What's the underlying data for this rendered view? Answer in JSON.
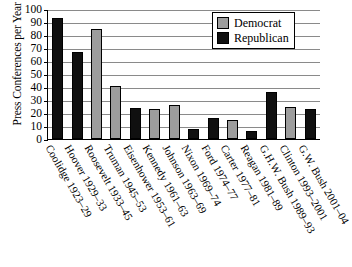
{
  "chart_data": {
    "type": "bar",
    "title": "",
    "xlabel": "",
    "ylabel": "Press Conferences per Year",
    "ylim": [
      0,
      100
    ],
    "yticks": [
      0,
      10,
      20,
      30,
      40,
      50,
      60,
      70,
      80,
      90,
      100
    ],
    "grid": true,
    "legend_position": "top-right",
    "categories": [
      "Coolidge 1923–29",
      "Hoover 1929–33",
      "Roosevelt 1933–45",
      "Truman 1945–53",
      "Eisenhower 1953–61",
      "Kennedy 1961–63",
      "Johnson 1963–69",
      "Nixon 1969–74",
      "Ford 1974–77",
      "Carter 1977–81",
      "Reagan 1981–89",
      "G.H.W. Bush 1989–93",
      "Clinton 1993–2001",
      "G.W. Bush 2001–04"
    ],
    "values": [
      93,
      67,
      85,
      41,
      24,
      23,
      26,
      8,
      16,
      15,
      6,
      36,
      25,
      23
    ],
    "party": [
      "republican",
      "republican",
      "democrat",
      "democrat",
      "republican",
      "democrat",
      "democrat",
      "republican",
      "republican",
      "democrat",
      "republican",
      "republican",
      "democrat",
      "republican"
    ],
    "series": [
      {
        "name": "Democrat",
        "color": "#9d9d9d",
        "points": [
          {
            "category": "Roosevelt 1933–45",
            "value": 85
          },
          {
            "category": "Truman 1945–53",
            "value": 41
          },
          {
            "category": "Kennedy 1961–63",
            "value": 23
          },
          {
            "category": "Johnson 1963–69",
            "value": 26
          },
          {
            "category": "Carter 1977–81",
            "value": 15
          },
          {
            "category": "Clinton 1993–2001",
            "value": 25
          }
        ]
      },
      {
        "name": "Republican",
        "color": "#101010",
        "points": [
          {
            "category": "Coolidge 1923–29",
            "value": 93
          },
          {
            "category": "Hoover 1929–33",
            "value": 67
          },
          {
            "category": "Eisenhower 1953–61",
            "value": 24
          },
          {
            "category": "Nixon 1969–74",
            "value": 8
          },
          {
            "category": "Ford 1974–77",
            "value": 16
          },
          {
            "category": "Reagan 1981–89",
            "value": 6
          },
          {
            "category": "G.H.W. Bush 1989–93",
            "value": 36
          },
          {
            "category": "G.W. Bush 2001–04",
            "value": 23
          }
        ]
      }
    ]
  },
  "legend": {
    "items": [
      {
        "label": "Democrat",
        "key": "democrat"
      },
      {
        "label": "Republican",
        "key": "republican"
      }
    ]
  },
  "colors": {
    "democrat": "#9d9d9d",
    "republican": "#101010",
    "gridline": "#8a8a8a",
    "axis": "#000000",
    "background": "#ffffff"
  }
}
